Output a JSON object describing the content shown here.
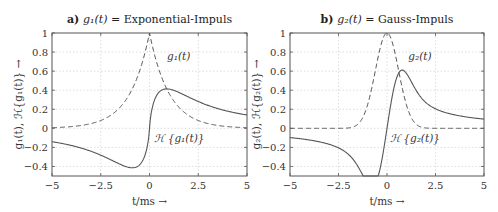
{
  "chart_data": [
    {
      "type": "line",
      "panel": "a",
      "title_prefix": "a)",
      "title": "g1(t) = Exponential-Impuls",
      "title_math": "g₁(t)",
      "title_rest": " = Exponential-Impuls",
      "xlabel": "t/ms →",
      "ylabel": "g1(t), H{g1(t)} →",
      "ylabel_text": "g₁(t), ℋ{g₁(t)} →",
      "xlim": [
        -5,
        5
      ],
      "ylim": [
        -0.5,
        1
      ],
      "xticks": [
        -5,
        -2.5,
        0,
        2.5,
        5
      ],
      "xtick_labels": [
        "−5",
        "−2.5",
        "0",
        "2.5",
        "5"
      ],
      "yticks": [
        1,
        0.8,
        0.6,
        0.4,
        0.2,
        0,
        -0.2,
        -0.4
      ],
      "ytick_labels": [
        "1",
        "0.8",
        "0.6",
        "0.4",
        "0.2",
        "0",
        "−0.2",
        "−0.4"
      ],
      "grid": true,
      "series": [
        {
          "name": "g1(t)",
          "label": "g₁(t)",
          "style": "dashed",
          "model": "exp(-|t|)",
          "x": [
            -5,
            -2.5,
            -1.5,
            -1,
            -0.5,
            0,
            0.5,
            1,
            1.5,
            2.5,
            5
          ],
          "values": [
            0.01,
            0.08,
            0.22,
            0.37,
            0.61,
            1.0,
            0.61,
            0.37,
            0.22,
            0.08,
            0.01
          ]
        },
        {
          "name": "H{g1(t)}",
          "label": "ℋ {g₁(t)}",
          "style": "solid",
          "x": [
            -5,
            -2.5,
            -1.5,
            -1,
            -0.4,
            0,
            0.4,
            1,
            1.5,
            2.5,
            5
          ],
          "values": [
            -0.02,
            -0.07,
            -0.13,
            -0.18,
            -0.22,
            0.0,
            0.22,
            0.18,
            0.13,
            0.07,
            0.02
          ]
        }
      ],
      "annotations": [
        {
          "text": "g₁(t)",
          "x": 0.9,
          "y": 0.72
        },
        {
          "text": "ℋ {g₁(t)}",
          "x": 0.25,
          "y": -0.14
        }
      ]
    },
    {
      "type": "line",
      "panel": "b",
      "title_prefix": "b)",
      "title": "g2(t) = Gauss-Impuls",
      "title_math": "g₂(t)",
      "title_rest": " = Gauss-Impuls",
      "xlabel": "t/ms →",
      "ylabel": "g2(t), H{g2(t)} →",
      "ylabel_text": "g₂(t), ℋ{g₂(t)} →",
      "xlim": [
        -5,
        5
      ],
      "ylim": [
        -0.5,
        1
      ],
      "xticks": [
        -5,
        -2.5,
        0,
        2.5,
        5
      ],
      "xtick_labels": [
        "−5",
        "−2.5",
        "0",
        "2.5",
        "5"
      ],
      "yticks": [
        1,
        0.8,
        0.6,
        0.4,
        0.2,
        0,
        -0.2,
        -0.4
      ],
      "ytick_labels": [
        "1",
        "0.8",
        "0.6",
        "0.4",
        "0.2",
        "0",
        "−0.2",
        "−0.4"
      ],
      "grid": true,
      "series": [
        {
          "name": "g2(t)",
          "label": "g₂(t)",
          "style": "dashed",
          "model": "exp(-pi*(t/1.5)^2)",
          "x": [
            -5,
            -2.5,
            -2,
            -1.5,
            -1,
            -0.5,
            0,
            0.5,
            1,
            1.5,
            2,
            2.5,
            5
          ],
          "values": [
            0.0,
            0.0,
            0.004,
            0.04,
            0.25,
            0.71,
            1.0,
            0.71,
            0.25,
            0.04,
            0.004,
            0.0,
            0.0
          ]
        },
        {
          "name": "H{g2(t)}",
          "label": "ℋ {g₂(t)}",
          "style": "solid",
          "x": [
            -5,
            -2.5,
            -2,
            -1.5,
            -0.7,
            0,
            0.7,
            1.5,
            2,
            2.5,
            5
          ],
          "values": [
            0.0,
            -0.01,
            -0.07,
            -0.19,
            -0.29,
            0.0,
            0.29,
            0.19,
            0.07,
            0.01,
            0.0
          ]
        }
      ],
      "annotations": [
        {
          "text": "g₂(t)",
          "x": 1.1,
          "y": 0.72
        },
        {
          "text": "ℋ {g₂(t)}",
          "x": 0.15,
          "y": -0.14
        }
      ]
    }
  ],
  "colors": {
    "axis": "#555555",
    "grid": "#d0d0d0",
    "curve": "#555555",
    "text": "#333333"
  }
}
